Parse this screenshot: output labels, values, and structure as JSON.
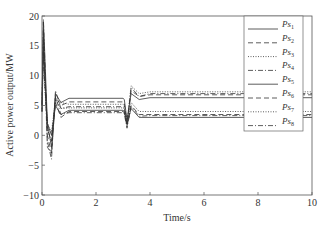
{
  "chart_data": {
    "type": "line",
    "title": "",
    "xlabel": "Time/s",
    "ylabel": "Active power output/MW",
    "xlim": [
      0,
      10
    ],
    "ylim": [
      -10,
      20
    ],
    "xticks": [
      0,
      2,
      4,
      6,
      8,
      10
    ],
    "yticks": [
      -10,
      -5,
      0,
      5,
      10,
      15,
      20
    ],
    "grid": false,
    "legend_position": "upper right",
    "series": [
      {
        "name": "Ps1",
        "label_base": "Ps",
        "label_sub": "1",
        "style": "solid",
        "x": [
          0,
          0.05,
          0.1,
          0.2,
          0.35,
          0.5,
          0.7,
          1.0,
          3.0,
          3.05,
          3.15,
          3.3,
          3.6,
          4.0,
          10
        ],
        "y": [
          5,
          19,
          14,
          2,
          -2,
          7,
          5.5,
          6.2,
          6.2,
          6.0,
          2.5,
          7.0,
          6.0,
          6.3,
          6.3
        ]
      },
      {
        "name": "Ps2",
        "label_base": "Ps",
        "label_sub": "2",
        "style": "dashed",
        "x": [
          0,
          0.05,
          0.1,
          0.2,
          0.35,
          0.5,
          0.7,
          1.0,
          3.0,
          3.05,
          3.15,
          3.3,
          3.6,
          4.0,
          10
        ],
        "y": [
          5,
          18,
          12,
          0,
          -3,
          6.5,
          5.0,
          5.6,
          5.6,
          5.4,
          2.0,
          7.5,
          6.5,
          6.8,
          6.8
        ]
      },
      {
        "name": "Ps3",
        "label_base": "Ps",
        "label_sub": "3",
        "style": "dotted",
        "x": [
          0,
          0.05,
          0.1,
          0.2,
          0.35,
          0.5,
          0.7,
          1.0,
          3.0,
          3.05,
          3.15,
          3.3,
          3.6,
          4.0,
          10
        ],
        "y": [
          5,
          17,
          11,
          1,
          -1,
          6,
          5.5,
          5.2,
          5.2,
          5.0,
          2.2,
          8.3,
          7.0,
          7.3,
          7.3
        ]
      },
      {
        "name": "Ps4",
        "label_base": "Ps",
        "label_sub": "4",
        "style": "dashdot",
        "x": [
          0,
          0.05,
          0.1,
          0.2,
          0.35,
          0.5,
          0.7,
          1.0,
          3.0,
          3.05,
          3.15,
          3.3,
          3.6,
          4.0,
          10
        ],
        "y": [
          5,
          19.5,
          13,
          -1,
          -4,
          7.5,
          4.5,
          4.8,
          4.8,
          4.6,
          1.5,
          8.0,
          6.5,
          7.0,
          7.0
        ]
      },
      {
        "name": "Ps5",
        "label_base": "Ps",
        "label_sub": "5",
        "style": "solid",
        "x": [
          0,
          0.05,
          0.1,
          0.2,
          0.35,
          0.5,
          0.7,
          1.0,
          3.0,
          3.05,
          3.15,
          3.3,
          3.6,
          4.0,
          10
        ],
        "y": [
          4,
          16,
          10,
          2,
          0,
          5,
          3.5,
          4.2,
          4.2,
          4.0,
          1.8,
          4.5,
          3.0,
          3.0,
          3.0
        ]
      },
      {
        "name": "Ps6",
        "label_base": "Ps",
        "label_sub": "6",
        "style": "dashed",
        "x": [
          0,
          0.05,
          0.1,
          0.2,
          0.35,
          0.5,
          0.7,
          1.0,
          3.0,
          3.05,
          3.15,
          3.3,
          3.6,
          4.0,
          10
        ],
        "y": [
          4,
          15,
          9,
          1,
          -1,
          5.5,
          3.0,
          4.0,
          4.0,
          3.8,
          1.6,
          5.0,
          3.5,
          3.5,
          3.5
        ]
      },
      {
        "name": "Ps7",
        "label_base": "Ps",
        "label_sub": "7",
        "style": "dotted",
        "x": [
          0,
          0.05,
          0.1,
          0.2,
          0.35,
          0.5,
          0.7,
          1.0,
          3.0,
          3.05,
          3.15,
          3.3,
          3.6,
          4.0,
          10
        ],
        "y": [
          4,
          14,
          8,
          2,
          0.5,
          6,
          4.5,
          4.6,
          4.6,
          4.4,
          2.0,
          5.5,
          4.0,
          4.0,
          4.0
        ]
      },
      {
        "name": "Ps8",
        "label_base": "Ps",
        "label_sub": "8",
        "style": "dashdot",
        "x": [
          0,
          0.05,
          0.1,
          0.2,
          0.35,
          0.5,
          0.7,
          1.0,
          3.0,
          3.05,
          3.15,
          3.3,
          3.6,
          4.0,
          10
        ],
        "y": [
          4,
          17,
          11,
          -2,
          -3,
          6.5,
          3.5,
          3.8,
          3.8,
          3.6,
          1.2,
          4.8,
          3.2,
          3.3,
          3.3
        ]
      }
    ]
  }
}
